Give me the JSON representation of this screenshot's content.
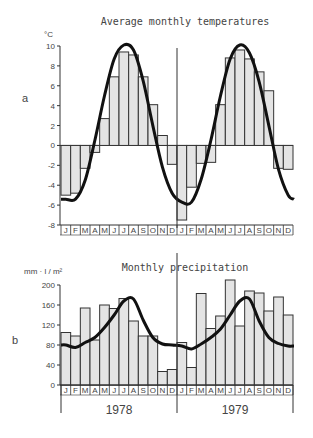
{
  "figure": {
    "panel_a_label": "a",
    "panel_b_label": "b",
    "years": [
      "1978",
      "1979"
    ],
    "months": [
      "J",
      "F",
      "M",
      "A",
      "M",
      "J",
      "J",
      "A",
      "S",
      "O",
      "N",
      "D"
    ]
  },
  "colors": {
    "bar_fill": "#e4e4e4",
    "bar_stroke": "#333333",
    "curve": "#111111",
    "axis": "#333333",
    "text": "#444444"
  },
  "chart_data": [
    {
      "type": "bar",
      "title": "Average monthly temperatures",
      "ylabel": "°C",
      "xlabel": "",
      "ylim": [
        -8,
        10
      ],
      "yticks": [
        10,
        8,
        6,
        4,
        2,
        0,
        -2,
        -4,
        -6,
        -8
      ],
      "categories": [
        "J",
        "F",
        "M",
        "A",
        "M",
        "J",
        "J",
        "A",
        "S",
        "O",
        "N",
        "D",
        "J",
        "F",
        "M",
        "A",
        "M",
        "J",
        "J",
        "A",
        "S",
        "O",
        "N",
        "D"
      ],
      "years": [
        "1978",
        "1979"
      ],
      "series": [
        {
          "name": "Monthly mean temperature (bars)",
          "values": [
            -5.0,
            -4.8,
            -2.3,
            -0.7,
            2.7,
            6.9,
            9.4,
            9.1,
            6.9,
            4.1,
            1.0,
            -1.9,
            -7.5,
            -4.2,
            -1.8,
            -1.7,
            4.1,
            8.8,
            9.6,
            8.7,
            7.4,
            5.5,
            -2.3,
            -2.4
          ]
        },
        {
          "name": "Smoothed curve",
          "values": [
            -5.4,
            -5.4,
            -3.5,
            0.5,
            5.0,
            8.7,
            10.1,
            9.6,
            6.5,
            2.0,
            -2.2,
            -4.8,
            -5.7,
            -5.7,
            -3.4,
            0.5,
            5.0,
            8.7,
            10.1,
            9.3,
            6.4,
            2.0,
            -2.4,
            -5.0
          ]
        }
      ],
      "legend": "none",
      "grid": false
    },
    {
      "type": "bar",
      "title": "Monthly precipitation",
      "ylabel": "mm · l / m²",
      "xlabel": "",
      "ylim": [
        0,
        200
      ],
      "yticks": [
        200,
        160,
        120,
        80,
        40,
        0
      ],
      "categories": [
        "J",
        "F",
        "M",
        "A",
        "M",
        "J",
        "J",
        "A",
        "S",
        "O",
        "N",
        "D",
        "J",
        "F",
        "M",
        "A",
        "M",
        "J",
        "J",
        "A",
        "S",
        "O",
        "N",
        "D"
      ],
      "years": [
        "1978",
        "1979"
      ],
      "series": [
        {
          "name": "Monthly precipitation (bars)",
          "values": [
            105,
            98,
            154,
            90,
            160,
            153,
            173,
            128,
            98,
            98,
            27,
            31,
            85,
            35,
            183,
            113,
            138,
            210,
            118,
            188,
            184,
            148,
            176,
            140
          ]
        },
        {
          "name": "Smoothed curve",
          "values": [
            80,
            75,
            85,
            95,
            115,
            140,
            168,
            172,
            130,
            95,
            82,
            80,
            78,
            72,
            82,
            95,
            112,
            140,
            168,
            172,
            128,
            95,
            83,
            78
          ]
        }
      ],
      "legend": "none",
      "grid": false
    }
  ]
}
